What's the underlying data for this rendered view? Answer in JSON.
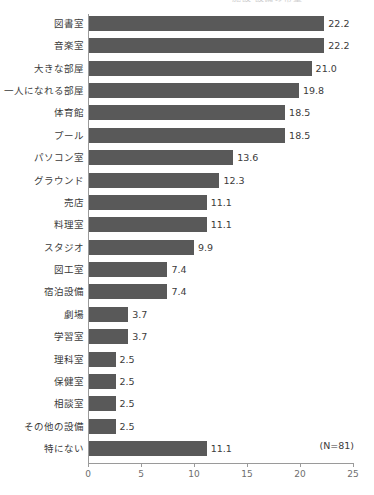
{
  "title_clipped": "施設・設備の希望",
  "annotation": "(N=81)",
  "chart_data": {
    "type": "bar",
    "orientation": "horizontal",
    "title": "",
    "xlabel": "",
    "ylabel": "",
    "xlim": [
      0,
      25
    ],
    "xticks": [
      0,
      5,
      10,
      15,
      20,
      25
    ],
    "xtick_labels": [
      "0",
      "5",
      "10",
      "15",
      "20",
      "25"
    ],
    "grid": false,
    "legend": false,
    "bar_color": "#595959",
    "axis_color": "#9a9a9a",
    "sample_note": "(N=81)",
    "categories": [
      "図書室",
      "音楽室",
      "大きな部屋",
      "一人になれる部屋",
      "体育館",
      "プール",
      "パソコン室",
      "グラウンド",
      "売店",
      "料理室",
      "スタジオ",
      "図工室",
      "宿泊設備",
      "劇場",
      "学習室",
      "理科室",
      "保健室",
      "相談室",
      "その他の設備",
      "特にない"
    ],
    "values": [
      22.2,
      22.2,
      21.0,
      19.8,
      18.5,
      18.5,
      13.6,
      12.3,
      11.1,
      11.1,
      9.9,
      7.4,
      7.4,
      3.7,
      3.7,
      2.5,
      2.5,
      2.5,
      2.5,
      11.1
    ],
    "value_labels": [
      "22.2",
      "22.2",
      "21.0",
      "19.8",
      "18.5",
      "18.5",
      "13.6",
      "12.3",
      "11.1",
      "11.1",
      "9.9",
      "7.4",
      "7.4",
      "3.7",
      "3.7",
      "2.5",
      "2.5",
      "2.5",
      "2.5",
      "11.1"
    ]
  }
}
